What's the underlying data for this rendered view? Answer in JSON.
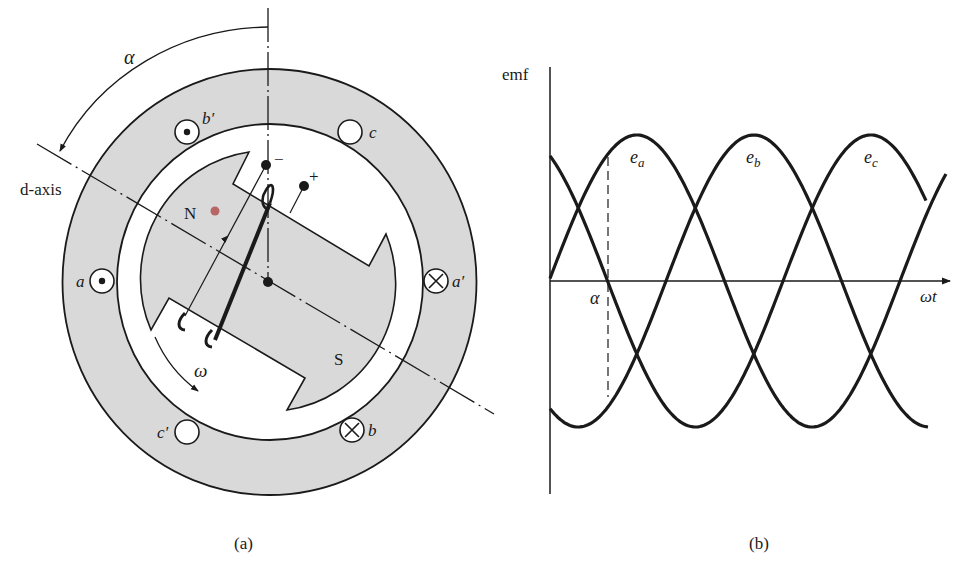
{
  "figure": {
    "panel_a": {
      "caption": "(a)",
      "labels": {
        "alpha": "α",
        "d_axis": "d-axis",
        "north": "N",
        "south": "S",
        "omega": "ω",
        "minus": "−",
        "plus": "+"
      },
      "slots": [
        {
          "id": "a",
          "label": "a",
          "symbol": "dot",
          "cx": 102,
          "cy": 281
        },
        {
          "id": "b_prime",
          "label": "b′",
          "symbol": "dot",
          "cx": 187,
          "cy": 132
        },
        {
          "id": "c",
          "label": "c",
          "symbol": "empty",
          "cx": 350,
          "cy": 132
        },
        {
          "id": "a_prime",
          "label": "a′",
          "symbol": "cross",
          "cx": 436,
          "cy": 281
        },
        {
          "id": "b",
          "label": "b",
          "symbol": "cross",
          "cx": 352,
          "cy": 430
        },
        {
          "id": "c_prime",
          "label": "c′",
          "symbol": "empty",
          "cx": 187,
          "cy": 432
        }
      ],
      "colors": {
        "iron": "#d9d9d9",
        "line": "#1a1a1a",
        "pole_dot": "#b05050"
      }
    },
    "panel_b": {
      "caption": "(b)"
    }
  },
  "chart_data": {
    "type": "line",
    "title": "",
    "xlabel": "ωt",
    "ylabel": "emf",
    "annotations": [
      {
        "text": "α",
        "x_deg": 90,
        "note": "dashed vertical marker where e_a crosses rotor angle α"
      }
    ],
    "x_units": "electrical degrees (ωt)",
    "x": [
      0,
      30,
      60,
      90,
      120,
      150,
      180,
      210,
      240,
      270,
      300,
      330,
      360,
      390
    ],
    "series": [
      {
        "name": "e_a",
        "label": "ea",
        "peak_deg": 89,
        "values": [
          0.02,
          0.51,
          0.87,
          1.0,
          0.87,
          0.49,
          -0.02,
          -0.51,
          -0.87,
          -1.0,
          -0.86,
          -0.49,
          0.02,
          0.51
        ]
      },
      {
        "name": "e_b",
        "label": "eb",
        "peak_deg": 209,
        "values": [
          -0.87,
          -1.0,
          -0.86,
          -0.49,
          0.01,
          0.5,
          0.87,
          1.0,
          0.87,
          0.5,
          -0.01,
          -0.5,
          -0.87,
          -1.0
        ]
      },
      {
        "name": "e_c",
        "label": "ec",
        "peak_deg": 329,
        "values": [
          0.86,
          0.5,
          -0.01,
          -0.5,
          -0.87,
          -1.0,
          -0.87,
          -0.5,
          0.0,
          0.5,
          0.86,
          1.0,
          0.87,
          0.5
        ]
      }
    ],
    "ylim": [
      -1.2,
      1.2
    ],
    "grid": false,
    "legend": "inline labels near peaks",
    "phase_shift_deg": 120
  }
}
